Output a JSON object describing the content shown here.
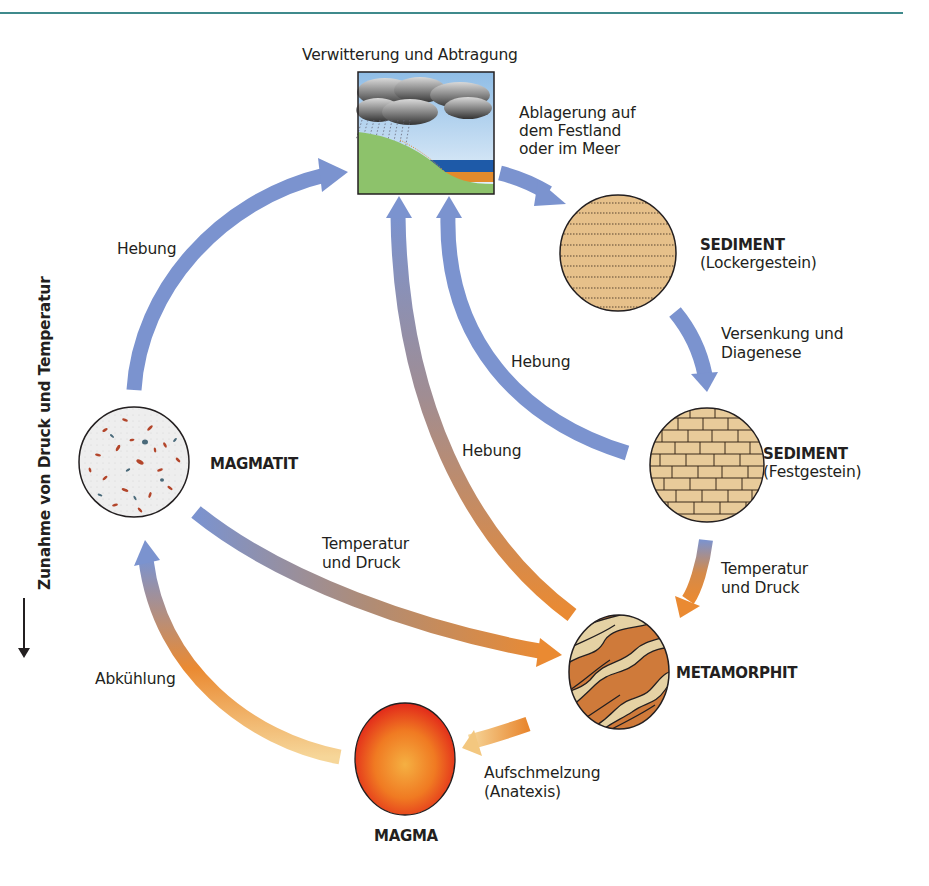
{
  "axis": {
    "label": "Zunahme von Druck und Temperatur",
    "direction": "down"
  },
  "nodes": {
    "weathering": {
      "label": "Verwitterung und Abtragung"
    },
    "sediment_loose": {
      "title": "SEDIMENT",
      "subtitle": "(Lockergestein)"
    },
    "sediment_solid": {
      "title": "SEDIMENT",
      "subtitle": "(Festgestein)"
    },
    "magmatite": {
      "title": "MAGMATIT"
    },
    "metamorphite": {
      "title": "METAMORPHIT"
    },
    "magma": {
      "title": "MAGMA"
    }
  },
  "processes": {
    "deposition": {
      "line1": "Ablagerung auf",
      "line2": "dem Festland",
      "line3": "oder im Meer"
    },
    "burial": {
      "line1": "Versenkung und",
      "line2": "Diagenese"
    },
    "uplift_left": {
      "label": "Hebung"
    },
    "uplift_mid": {
      "label": "Hebung"
    },
    "uplift_right": {
      "label": "Hebung"
    },
    "temp_pressure_left": {
      "line1": "Temperatur",
      "line2": "und Druck"
    },
    "temp_pressure_right": {
      "line1": "Temperatur",
      "line2": "und Druck"
    },
    "cooling": {
      "label": "Abkühlung"
    },
    "melting": {
      "line1": "Aufschmelzung",
      "line2": "(Anatexis)"
    }
  },
  "colors": {
    "rule": "#3f8a8c",
    "arrow_blue": "#7b93cf",
    "arrow_orange": "#e8862e",
    "arrow_light": "#f3c77f",
    "sediment_fill": "#e6c08a",
    "magma_core": "#f5a623",
    "magma_edge": "#e2321b",
    "metamorph_dark": "#cf7a3a",
    "metamorph_light": "#e5d2a4",
    "ground": "#8dc26b",
    "sea": "#1e5aa8",
    "sand": "#e38b2c"
  }
}
